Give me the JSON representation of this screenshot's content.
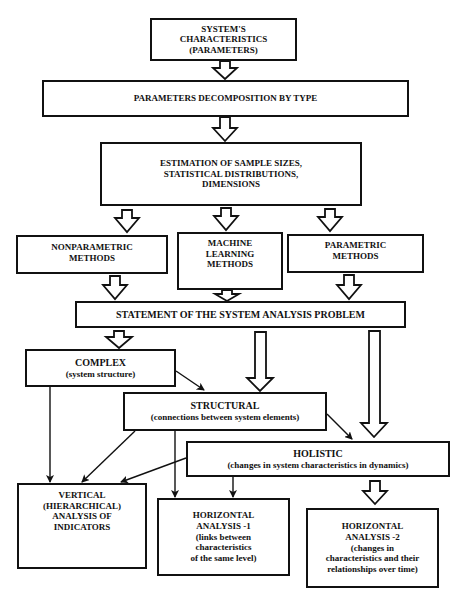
{
  "diagram": {
    "nodes": {
      "characteristics": {
        "lines": [
          "SYSTEM'S",
          "CHARACTERISTICS",
          "(PARAMETERS)"
        ]
      },
      "decomposition": {
        "lines": [
          "PARAMETERS DECOMPOSITION BY TYPE"
        ]
      },
      "estimation": {
        "lines": [
          "ESTIMATION OF SAMPLE SIZES,",
          "STATISTICAL DISTRIBUTIONS,",
          "DIMENSIONS"
        ]
      },
      "nonparametric": {
        "lines": [
          "NONPARAMETRIC",
          "METHODS"
        ]
      },
      "machine_learning": {
        "lines": [
          "MACHINE",
          "LEARNING",
          "METHODS"
        ]
      },
      "parametric": {
        "lines": [
          "PARAMETRIC",
          "METHODS"
        ]
      },
      "statement": {
        "lines": [
          "STATEMENT OF THE SYSTEM ANALYSIS PROBLEM"
        ]
      },
      "complex": {
        "lines": [
          "COMPLEX",
          "(system structure)"
        ]
      },
      "structural": {
        "lines": [
          "STRUCTURAL",
          "(connections between system elements)"
        ]
      },
      "holistic": {
        "lines": [
          "HOLISTIC",
          "(changes in system characteristics in dynamics)"
        ]
      },
      "vertical": {
        "lines": [
          "VERTICAL",
          "(HIERARCHICAL)",
          "ANALYSIS OF",
          "INDICATORS"
        ]
      },
      "horizontal1": {
        "lines": [
          "HORIZONTAL",
          "ANALYSIS -1",
          "(links between",
          "characteristics",
          "of the same level)"
        ]
      },
      "horizontal2": {
        "lines": [
          "HORIZONTAL",
          "ANALYSIS -2",
          "(changes in",
          "characteristics and their",
          "relationships over time)"
        ]
      }
    },
    "edges": [
      {
        "from": "characteristics",
        "to": "decomposition",
        "style": "hollow-arrow"
      },
      {
        "from": "decomposition",
        "to": "estimation",
        "style": "hollow-arrow"
      },
      {
        "from": "estimation",
        "to": "nonparametric",
        "style": "hollow-arrow"
      },
      {
        "from": "estimation",
        "to": "machine_learning",
        "style": "hollow-arrow"
      },
      {
        "from": "estimation",
        "to": "parametric",
        "style": "hollow-arrow"
      },
      {
        "from": "nonparametric",
        "to": "statement",
        "style": "hollow-arrow"
      },
      {
        "from": "machine_learning",
        "to": "statement",
        "style": "hollow-arrow"
      },
      {
        "from": "parametric",
        "to": "statement",
        "style": "hollow-arrow"
      },
      {
        "from": "statement",
        "to": "complex",
        "style": "hollow-arrow"
      },
      {
        "from": "statement",
        "to": "structural",
        "style": "hollow-arrow"
      },
      {
        "from": "statement",
        "to": "holistic",
        "style": "hollow-arrow"
      },
      {
        "from": "complex",
        "to": "structural",
        "style": "line-arrow"
      },
      {
        "from": "complex",
        "to": "vertical",
        "style": "line-arrow"
      },
      {
        "from": "structural",
        "to": "holistic",
        "style": "line-arrow"
      },
      {
        "from": "structural",
        "to": "vertical",
        "style": "line-arrow"
      },
      {
        "from": "structural",
        "to": "horizontal1",
        "style": "line-arrow"
      },
      {
        "from": "holistic",
        "to": "vertical",
        "style": "line-arrow"
      },
      {
        "from": "holistic",
        "to": "horizontal1",
        "style": "line-arrow"
      },
      {
        "from": "holistic",
        "to": "horizontal2",
        "style": "hollow-arrow"
      }
    ]
  }
}
